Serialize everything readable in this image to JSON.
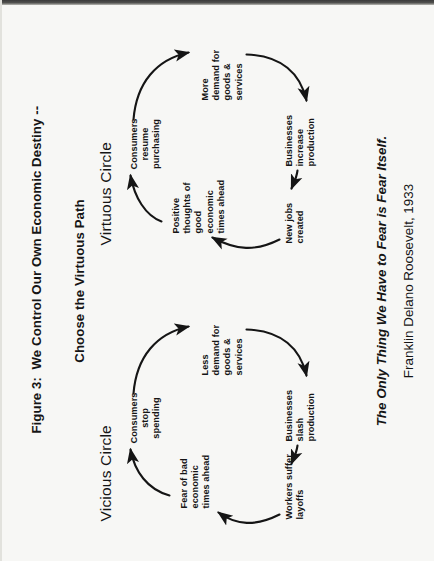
{
  "figure": {
    "title_line1": "Figure 3:  We Control Our Own Economic Destiny --",
    "title_line2": "Choose the Virtuous Path",
    "quote": "The Only Thing We Have to Fear is Fear Itself.",
    "attribution": "Franklin Delano Roosevelt, 1933",
    "background_color": "#f7f7f5",
    "ink_color": "#151515"
  },
  "diagram_data": {
    "type": "diagram",
    "orientation": "rotated-90-ccw",
    "loops": [
      {
        "id": "vicious",
        "heading": "Vicious Circle",
        "direction": "clockwise",
        "nodes": [
          {
            "id": "v1",
            "label": "Consumers\nstop\nspending"
          },
          {
            "id": "v2",
            "label": "Less\ndemand for\ngoods &\nservices"
          },
          {
            "id": "v3",
            "label": "Businesses\nslash\nproduction"
          },
          {
            "id": "v4",
            "label": "Workers suffer\nlayoffs"
          },
          {
            "id": "v5",
            "label": "Fear of bad\neconomic\ntimes ahead"
          }
        ],
        "edges": [
          {
            "from": "v1",
            "to": "v2"
          },
          {
            "from": "v2",
            "to": "v3"
          },
          {
            "from": "v3",
            "to": "v4"
          },
          {
            "from": "v4",
            "to": "v5"
          },
          {
            "from": "v5",
            "to": "v1"
          }
        ]
      },
      {
        "id": "virtuous",
        "heading": "Virtuous Circle",
        "direction": "clockwise",
        "nodes": [
          {
            "id": "g1",
            "label": "Consumers\nresume\npurchasing"
          },
          {
            "id": "g2",
            "label": "More\ndemand for\ngoods &\nservices"
          },
          {
            "id": "g3",
            "label": "Businesses\nincrease\nproduction"
          },
          {
            "id": "g4",
            "label": "New jobs\ncreated"
          },
          {
            "id": "g5",
            "label": "Positive\nthoughts of\ngood\neconomic\ntimes ahead"
          }
        ],
        "edges": [
          {
            "from": "g1",
            "to": "g2"
          },
          {
            "from": "g2",
            "to": "g3"
          },
          {
            "from": "g3",
            "to": "g4"
          },
          {
            "from": "g4",
            "to": "g5"
          },
          {
            "from": "g5",
            "to": "g1"
          }
        ]
      }
    ]
  }
}
